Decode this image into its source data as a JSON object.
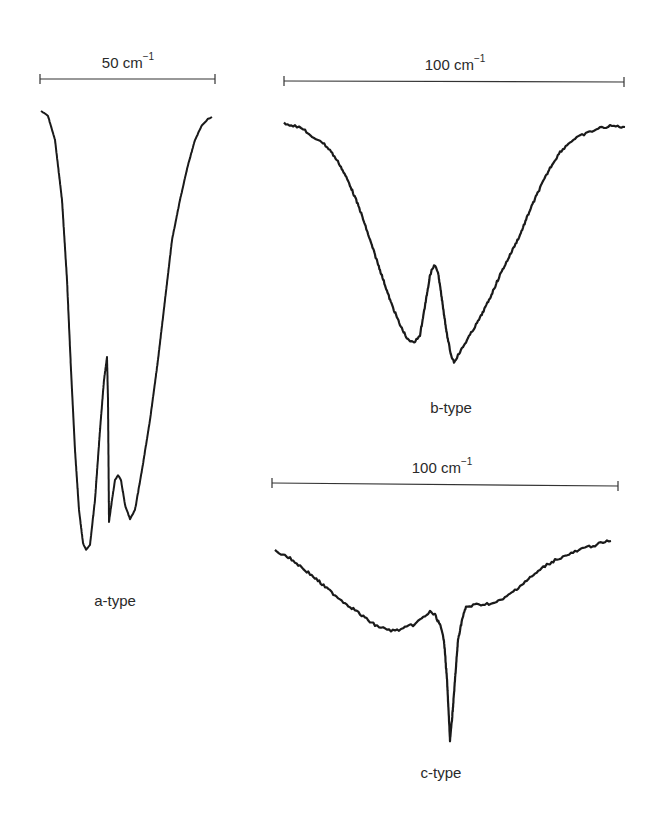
{
  "chart_data": [
    {
      "type": "line",
      "panel": "a",
      "title": "",
      "label": "a-type",
      "scale_bar": {
        "value": 50,
        "unit": "cm⁻¹",
        "text": "50 cm",
        "exp": "−1"
      },
      "xlabel": "",
      "ylabel": "",
      "grid": false,
      "description": "Deep absorption band with sharp central Q-branch spike and a smaller side lobe",
      "points_px": [
        [
          41,
          111
        ],
        [
          48,
          116
        ],
        [
          55,
          140
        ],
        [
          62,
          200
        ],
        [
          67,
          280
        ],
        [
          71,
          370
        ],
        [
          75,
          450
        ],
        [
          79,
          510
        ],
        [
          83,
          543
        ],
        [
          86,
          550
        ],
        [
          90,
          545
        ],
        [
          95,
          500
        ],
        [
          100,
          430
        ],
        [
          104,
          380
        ],
        [
          107,
          357
        ],
        [
          108,
          400
        ],
        [
          109,
          522
        ],
        [
          112,
          500
        ],
        [
          115,
          480
        ],
        [
          118,
          475
        ],
        [
          121,
          480
        ],
        [
          125,
          505
        ],
        [
          130,
          519
        ],
        [
          135,
          510
        ],
        [
          142,
          470
        ],
        [
          150,
          420
        ],
        [
          158,
          360
        ],
        [
          165,
          300
        ],
        [
          172,
          240
        ],
        [
          180,
          200
        ],
        [
          188,
          165
        ],
        [
          195,
          140
        ],
        [
          202,
          125
        ],
        [
          208,
          119
        ],
        [
          212,
          117
        ]
      ]
    },
    {
      "type": "line",
      "panel": "b",
      "title": "",
      "label": "b-type",
      "scale_bar": {
        "value": 100,
        "unit": "cm⁻¹",
        "text": "100 cm",
        "exp": "−1"
      },
      "xlabel": "",
      "ylabel": "",
      "grid": false,
      "description": "Broad band with central dip; two minima separated by a peak (no Q-branch)",
      "points_px": [
        [
          284,
          123
        ],
        [
          295,
          126
        ],
        [
          305,
          130
        ],
        [
          312,
          138
        ],
        [
          320,
          140
        ],
        [
          330,
          150
        ],
        [
          340,
          165
        ],
        [
          350,
          185
        ],
        [
          360,
          210
        ],
        [
          370,
          240
        ],
        [
          380,
          270
        ],
        [
          390,
          300
        ],
        [
          400,
          325
        ],
        [
          408,
          340
        ],
        [
          414,
          343
        ],
        [
          420,
          335
        ],
        [
          426,
          300
        ],
        [
          430,
          275
        ],
        [
          434,
          265
        ],
        [
          438,
          272
        ],
        [
          442,
          300
        ],
        [
          447,
          335
        ],
        [
          451,
          355
        ],
        [
          454,
          362
        ],
        [
          460,
          352
        ],
        [
          470,
          335
        ],
        [
          480,
          318
        ],
        [
          490,
          298
        ],
        [
          500,
          275
        ],
        [
          510,
          255
        ],
        [
          520,
          235
        ],
        [
          530,
          210
        ],
        [
          540,
          188
        ],
        [
          550,
          168
        ],
        [
          560,
          152
        ],
        [
          570,
          142
        ],
        [
          580,
          136
        ],
        [
          590,
          132
        ],
        [
          600,
          128
        ],
        [
          612,
          126
        ],
        [
          625,
          127
        ]
      ]
    },
    {
      "type": "line",
      "panel": "c",
      "title": "",
      "label": "c-type",
      "scale_bar": {
        "value": 100,
        "unit": "cm⁻¹",
        "text": "100 cm",
        "exp": "−1"
      },
      "xlabel": "",
      "ylabel": "",
      "grid": false,
      "description": "Shallow broad band with very sharp, intense central Q-branch",
      "points_px": [
        [
          275,
          551
        ],
        [
          285,
          555
        ],
        [
          295,
          562
        ],
        [
          305,
          570
        ],
        [
          315,
          578
        ],
        [
          325,
          587
        ],
        [
          335,
          595
        ],
        [
          345,
          603
        ],
        [
          355,
          610
        ],
        [
          365,
          618
        ],
        [
          375,
          625
        ],
        [
          385,
          629
        ],
        [
          395,
          631
        ],
        [
          405,
          628
        ],
        [
          415,
          624
        ],
        [
          425,
          616
        ],
        [
          430,
          612
        ],
        [
          435,
          615
        ],
        [
          440,
          625
        ],
        [
          444,
          640
        ],
        [
          447,
          680
        ],
        [
          449,
          720
        ],
        [
          450,
          740
        ],
        [
          452,
          720
        ],
        [
          455,
          680
        ],
        [
          458,
          640
        ],
        [
          462,
          620
        ],
        [
          466,
          607
        ],
        [
          475,
          605
        ],
        [
          485,
          604
        ],
        [
          495,
          603
        ],
        [
          505,
          598
        ],
        [
          515,
          590
        ],
        [
          525,
          582
        ],
        [
          535,
          574
        ],
        [
          545,
          566
        ],
        [
          555,
          560
        ],
        [
          565,
          556
        ],
        [
          575,
          552
        ],
        [
          585,
          548
        ],
        [
          595,
          545
        ],
        [
          605,
          542
        ],
        [
          611,
          541
        ]
      ]
    }
  ],
  "labels": {
    "a": "a-type",
    "b": "b-type",
    "c": "c-type"
  },
  "scales": {
    "a": {
      "text": "50 cm",
      "exp": "−1"
    },
    "b": {
      "text": "100 cm",
      "exp": "−1"
    },
    "c": {
      "text": "100 cm",
      "exp": "−1"
    }
  },
  "colors": {
    "trace": "#1a1a1a",
    "scale_bar": "#333333",
    "text": "#2a2a2a"
  }
}
